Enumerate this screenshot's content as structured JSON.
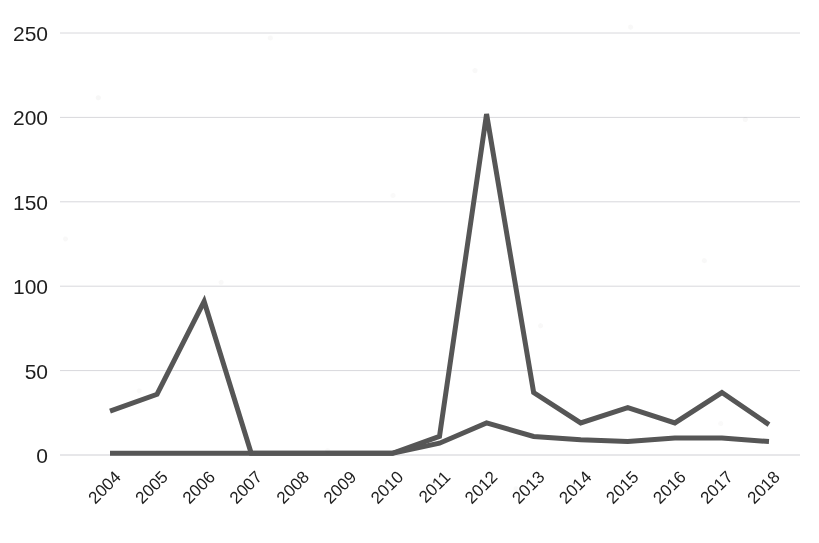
{
  "chart_data": {
    "type": "line",
    "title": "",
    "subtitle": "",
    "xlabel": "",
    "ylabel": "",
    "categories": [
      "2004",
      "2005",
      "2006",
      "2007",
      "2008",
      "2009",
      "2010",
      "2011",
      "2012",
      "2013",
      "2014",
      "2015",
      "2016",
      "2017",
      "2018"
    ],
    "x_tick_labels": [
      "2004",
      "2005",
      "2006",
      "2007",
      "2008",
      "2009",
      "2010",
      "2011",
      "2012",
      "2013",
      "2014",
      "2015",
      "2016",
      "2017",
      "2018"
    ],
    "y_tick_labels": [
      "0",
      "50",
      "100",
      "150",
      "200",
      "250"
    ],
    "y_ticks": [
      0,
      50,
      100,
      150,
      200,
      250
    ],
    "ylim": [
      0,
      250
    ],
    "grid": "horizontal",
    "legend": "none",
    "x_tick_rotation_degrees": -45,
    "series": [
      {
        "name": "series-1",
        "color": "#565656",
        "stroke_width": 5,
        "values": [
          26,
          36,
          91,
          1,
          1,
          1,
          1,
          11,
          202,
          37,
          19,
          28,
          19,
          37,
          18
        ]
      },
      {
        "name": "series-2",
        "color": "#565656",
        "stroke_width": 5,
        "values": [
          1,
          1,
          1,
          1,
          1,
          1,
          1,
          7,
          19,
          11,
          9,
          8,
          10,
          10,
          8
        ]
      }
    ]
  },
  "axis": {
    "y_labels": [
      "250",
      "200",
      "150",
      "100",
      "50",
      "0"
    ],
    "x_labels": [
      "2004",
      "2005",
      "2006",
      "2007",
      "2008",
      "2009",
      "2010",
      "2011",
      "2012",
      "2013",
      "2014",
      "2015",
      "2016",
      "2017",
      "2018"
    ]
  },
  "colors": {
    "line": "#565656",
    "gridline": "#d8d8dc",
    "text": "#1e1e1e",
    "background": "#ffffff"
  }
}
